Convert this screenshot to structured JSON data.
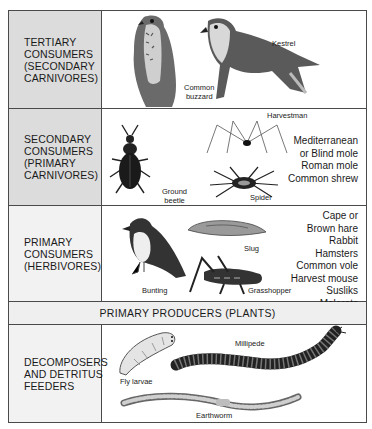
{
  "diagram": {
    "rows": [
      {
        "label": "TERTIARY\nCONSUMERS\n(SECONDARY\nCARNIVORES)",
        "animals": [
          {
            "name": "Common\nbuzzard",
            "icon": "buzzard-icon"
          },
          {
            "name": "Kestrel",
            "icon": "kestrel-icon"
          }
        ],
        "species": []
      },
      {
        "label": "SECONDARY\nCONSUMERS\n(PRIMARY\nCARNIVORES)",
        "animals": [
          {
            "name": "Ground\nbeetle",
            "icon": "beetle-icon"
          },
          {
            "name": "Harvestman",
            "icon": "harvestman-icon"
          },
          {
            "name": "Spider",
            "icon": "spider-icon"
          }
        ],
        "species": [
          "Mediterranean",
          "or Blind mole",
          "Roman mole",
          "Common  shrew"
        ]
      },
      {
        "label": "PRIMARY\nCONSUMERS\n(HERBIVORES)",
        "animals": [
          {
            "name": "Bunting",
            "icon": "bunting-icon"
          },
          {
            "name": "Slug",
            "icon": "slug-icon"
          },
          {
            "name": "Grasshopper",
            "icon": "grasshopper-icon"
          }
        ],
        "species": [
          "Cape or",
          "Brown  hare",
          "Rabbit",
          "Hamsters",
          "Common  vole",
          "Harvest mouse",
          "Susliks",
          "Molerats"
        ]
      },
      {
        "label": "PRIMARY PRODUCERS (PLANTS)"
      },
      {
        "label": "DECOMPOSERS\nAND DETRITUS\nFEEDERS",
        "animals": [
          {
            "name": "Fly larvae",
            "icon": "fly-larvae-icon"
          },
          {
            "name": "Millipede",
            "icon": "millipede-icon"
          },
          {
            "name": "Earthworm",
            "icon": "earthworm-icon"
          }
        ],
        "species": []
      }
    ],
    "colors": {
      "label_shaded": "#dcdcdc",
      "label_light": "#f2f2f2",
      "border": "#4a4a4a"
    }
  }
}
